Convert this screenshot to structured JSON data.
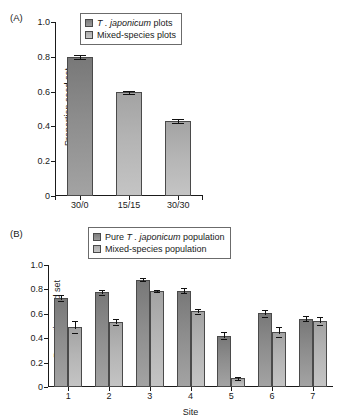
{
  "figure": {
    "panel_a_label": "(A)",
    "panel_b_label": "(B)"
  },
  "panel_a": {
    "legend": {
      "series1_prefix": "",
      "series1_species": "T . japonicum",
      "series1_suffix": " plots",
      "series2_label": "Mixed-species plots"
    },
    "ylabel": "Proportion seed set",
    "yticks": [
      "0",
      "0.2",
      "0.4",
      "0.6",
      "0.8",
      "1.0"
    ]
  },
  "panel_b": {
    "legend": {
      "series1_prefix": "Pure ",
      "series1_species": "T . japonicum",
      "series1_suffix": " population",
      "series2_label": "Mixed-species population"
    },
    "ylabel": "Proportion seed set",
    "xlabel": "Site",
    "yticks": [
      "0",
      "0.2",
      "0.4",
      "0.6",
      "0.8",
      "1.0"
    ]
  },
  "chart_data": [
    {
      "type": "bar",
      "panel": "(A)",
      "title": "",
      "xlabel": "",
      "ylabel": "Proportion seed set",
      "ylim": [
        0,
        1.0
      ],
      "yticks": [
        0,
        0.2,
        0.4,
        0.6,
        0.8,
        1.0
      ],
      "grid": false,
      "legend_position": "top-center",
      "categories": [
        "30/0",
        "15/15",
        "30/30"
      ],
      "values": [
        0.8,
        0.595,
        0.43
      ],
      "errors": [
        0.012,
        0.01,
        0.01
      ],
      "bar_shades": [
        "dark",
        "light",
        "light"
      ],
      "legend": [
        "T . japonicum plots",
        "Mixed-species plots"
      ]
    },
    {
      "type": "bar",
      "panel": "(B)",
      "title": "",
      "xlabel": "Site",
      "ylabel": "Proportion seed set",
      "ylim": [
        0,
        1.0
      ],
      "yticks": [
        0,
        0.2,
        0.4,
        0.6,
        0.8,
        1.0
      ],
      "grid": false,
      "legend_position": "top-center",
      "categories": [
        "1",
        "2",
        "3",
        "4",
        "5",
        "6",
        "7"
      ],
      "series": [
        {
          "name": "Pure T . japonicum population",
          "shade": "dark",
          "values": [
            0.73,
            0.775,
            0.88,
            0.79,
            0.42,
            0.605,
            0.56
          ],
          "errors": [
            0.027,
            0.018,
            0.01,
            0.022,
            0.03,
            0.028,
            0.02
          ]
        },
        {
          "name": "Mixed-species population",
          "shade": "light",
          "values": [
            0.49,
            0.53,
            0.785,
            0.62,
            0.07,
            0.45,
            0.54
          ],
          "errors": [
            0.047,
            0.024,
            0.008,
            0.018,
            0.01,
            0.04,
            0.03
          ]
        }
      ]
    }
  ]
}
